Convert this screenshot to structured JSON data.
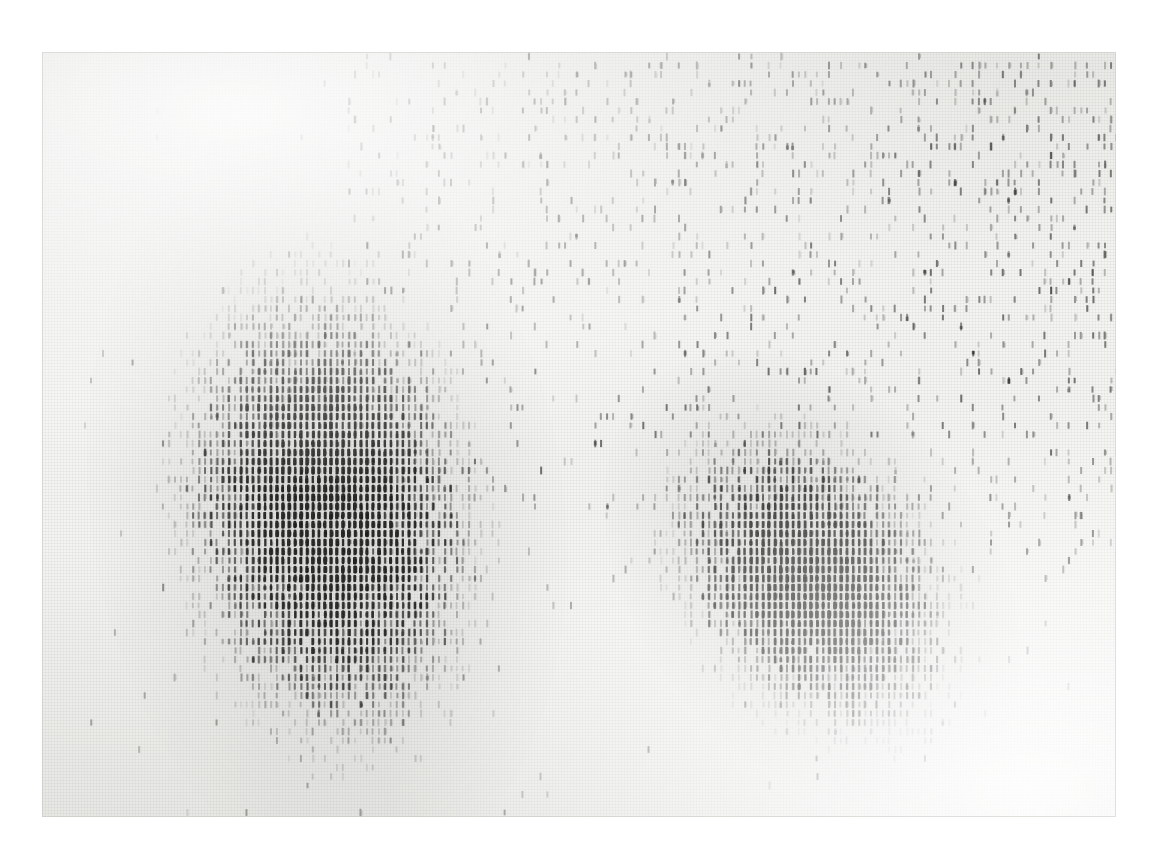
{
  "figure": {
    "kind": "scanned-line-printer-scatter-plot",
    "caption": "",
    "title": "",
    "paper_color": "#f4f4f2",
    "ink_color": "#2a2a2a",
    "background_color": "#ffffff",
    "sheet": {
      "left": 42,
      "top": 52,
      "width": 1074,
      "height": 765
    },
    "glyph": {
      "name": "vertical-stroke",
      "char": "|",
      "cell_width": 6,
      "cell_height": 9,
      "stroke_width": 2,
      "stroke_height": 8
    }
  },
  "chart_data": {
    "type": "scatter",
    "title": "",
    "subtitle": "",
    "xlabel": "",
    "ylabel": "",
    "xlim": [
      0,
      1074
    ],
    "ylim": [
      0,
      765
    ],
    "grid": false,
    "legend": null,
    "axis_visible": false,
    "tick_labels_x": [],
    "tick_labels_y": [],
    "annotations": [],
    "encoding": "overstrike-density",
    "render_seed": 20240517,
    "series": [
      {
        "name": "cluster-1",
        "role": "dense-cluster",
        "marker": "vertical-stroke",
        "center_x": 285,
        "center_y": 455,
        "radius_x": 135,
        "radius_y": 215,
        "rotation_deg": -8,
        "n_points": 7600,
        "peak_darkness": 0.92,
        "edge_softness": 0.34
      },
      {
        "name": "cluster-2",
        "role": "dense-cluster",
        "marker": "vertical-stroke",
        "center_x": 770,
        "center_y": 525,
        "radius_x": 112,
        "radius_y": 160,
        "rotation_deg": -38,
        "n_points": 4400,
        "peak_darkness": 0.88,
        "edge_softness": 0.38
      },
      {
        "name": "background-scatter",
        "role": "sparse-noise",
        "marker": "vertical-stroke",
        "n_points": 2100,
        "density_bias": "upper-right",
        "peak_darkness": 0.55,
        "x_range": [
          300,
          1074
        ],
        "y_range": [
          0,
          520
        ]
      },
      {
        "name": "stray-marks",
        "role": "isolated-outliers",
        "marker": "vertical-stroke",
        "n_points": 260,
        "peak_darkness": 0.45,
        "x_range": [
          40,
          1074
        ],
        "y_range": [
          0,
          765
        ]
      }
    ]
  }
}
